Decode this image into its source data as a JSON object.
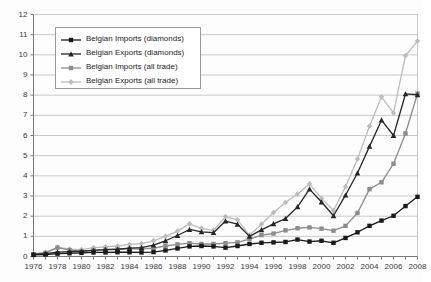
{
  "chart_data": {
    "type": "line",
    "title": "",
    "subtitle": "",
    "xlabel": "",
    "ylabel": "",
    "xlim": [
      1976,
      2008
    ],
    "ylim": [
      0,
      12
    ],
    "ytick_step": 1,
    "xtick_step": 2,
    "grid": "horizontal",
    "legend_position": "upper-left-inside",
    "x": [
      1976,
      1977,
      1978,
      1979,
      1980,
      1981,
      1982,
      1983,
      1984,
      1985,
      1986,
      1987,
      1988,
      1989,
      1990,
      1991,
      1992,
      1993,
      1994,
      1995,
      1996,
      1997,
      1998,
      1999,
      2000,
      2001,
      2002,
      2003,
      2004,
      2005,
      2006,
      2007,
      2008
    ],
    "xtick_labels": [
      "1976",
      "1978",
      "1980",
      "1982",
      "1984",
      "1986",
      "1988",
      "1990",
      "1992",
      "1994",
      "1996",
      "1998",
      "2000",
      "2002",
      "2004",
      "2006",
      "2008"
    ],
    "ytick_labels": [
      "0",
      "1",
      "2",
      "3",
      "4",
      "5",
      "6",
      "7",
      "8",
      "9",
      "10",
      "11",
      "12"
    ],
    "series": [
      {
        "name": "Belgian Imports (diamonds)",
        "marker": "square",
        "color": "#1a1a1a",
        "values": [
          0.08,
          0.1,
          0.14,
          0.16,
          0.18,
          0.2,
          0.2,
          0.21,
          0.21,
          0.2,
          0.22,
          0.3,
          0.4,
          0.5,
          0.52,
          0.5,
          0.44,
          0.52,
          0.62,
          0.68,
          0.7,
          0.72,
          0.84,
          0.74,
          0.78,
          0.68,
          0.92,
          1.2,
          1.52,
          1.78,
          2.02,
          2.5,
          2.96
        ]
      },
      {
        "name": "Belgian Exports (diamonds)",
        "marker": "triangle",
        "color": "#262626",
        "values": [
          0.1,
          0.14,
          0.22,
          0.24,
          0.26,
          0.3,
          0.34,
          0.36,
          0.42,
          0.44,
          0.56,
          0.78,
          1.04,
          1.34,
          1.22,
          1.18,
          1.76,
          1.6,
          1.0,
          1.32,
          1.62,
          1.88,
          2.46,
          3.34,
          2.7,
          2.02,
          3.04,
          4.14,
          5.46,
          6.76,
          6.0,
          8.06,
          8.02
        ]
      },
      {
        "name": "Belgian Imports (all trade)",
        "marker": "square",
        "color": "#8c8c8c",
        "values": [
          0.12,
          0.18,
          0.44,
          0.32,
          0.26,
          0.32,
          0.34,
          0.36,
          0.38,
          0.38,
          0.42,
          0.52,
          0.6,
          0.66,
          0.62,
          0.62,
          0.66,
          0.7,
          0.86,
          1.06,
          1.14,
          1.3,
          1.4,
          1.44,
          1.38,
          1.28,
          1.52,
          2.16,
          3.34,
          3.68,
          4.6,
          6.1,
          8.08
        ]
      },
      {
        "name": "Belgian Exports (all trade)",
        "marker": "diamond",
        "color": "#bcbcbc",
        "values": [
          0.14,
          0.2,
          0.46,
          0.36,
          0.34,
          0.44,
          0.48,
          0.52,
          0.6,
          0.64,
          0.78,
          1.0,
          1.26,
          1.62,
          1.4,
          1.3,
          1.98,
          1.82,
          1.06,
          1.6,
          2.18,
          2.68,
          3.1,
          3.6,
          2.88,
          2.28,
          3.46,
          4.84,
          6.46,
          7.92,
          7.12,
          9.96,
          10.68
        ]
      }
    ]
  },
  "legend": {
    "items": [
      {
        "label": "Belgian Imports (diamonds)"
      },
      {
        "label": "Belgian Exports (diamonds)"
      },
      {
        "label": "Belgian Imports (all trade)"
      },
      {
        "label": "Belgian Exports (all trade)"
      }
    ]
  },
  "colors": {
    "axis": "#7a7a7a",
    "grid": "#c9c9c9",
    "background": "#fdfdfd",
    "text": "#3a3a3a"
  }
}
